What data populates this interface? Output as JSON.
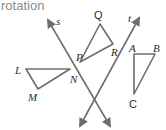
{
  "title": "rotation",
  "colors": {
    "stroke": "#6e6e6e",
    "text": "#2b2b2b",
    "title": "#8c8c8c"
  },
  "lines": [
    {
      "name": "s",
      "label": "s"
    },
    {
      "name": "t",
      "label": "t"
    }
  ],
  "triangles": [
    {
      "name": "LMN",
      "vertices": [
        "L",
        "M",
        "N"
      ]
    },
    {
      "name": "PQR",
      "vertices": [
        "P",
        "Q",
        "R"
      ]
    },
    {
      "name": "ABC",
      "vertices": [
        "A",
        "B",
        "C"
      ]
    }
  ],
  "labels": {
    "s": "s",
    "t": "t",
    "L": "L",
    "M": "M",
    "N": "N",
    "P": "P",
    "Q": "Q",
    "R": "R",
    "A": "A",
    "B": "B",
    "C": "C"
  }
}
